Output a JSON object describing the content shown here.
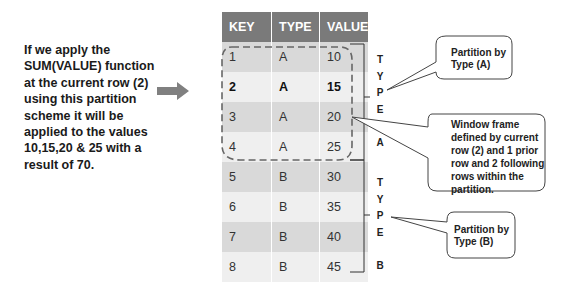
{
  "explanation": {
    "lines": [
      "If we apply the",
      "SUM(VALUE) function",
      "at the current row (2)",
      "using this partition",
      "scheme it will be",
      "applied to the values",
      "10,15,20 & 25 with a",
      "result of 70."
    ]
  },
  "arrow_icon": "right-arrow",
  "table": {
    "headers": [
      "KEY",
      "TYPE",
      "VALUE"
    ],
    "rows": [
      {
        "key": "1",
        "type": "A",
        "value": "10"
      },
      {
        "key": "2",
        "type": "A",
        "value": "15"
      },
      {
        "key": "3",
        "type": "A",
        "value": "20"
      },
      {
        "key": "4",
        "type": "A",
        "value": "25"
      },
      {
        "key": "5",
        "type": "B",
        "value": "30"
      },
      {
        "key": "6",
        "type": "B",
        "value": "35"
      },
      {
        "key": "7",
        "type": "B",
        "value": "40"
      },
      {
        "key": "8",
        "type": "B",
        "value": "45"
      }
    ],
    "current_row_key": "2",
    "header_color": "#7a7a7a"
  },
  "partitions": {
    "a": {
      "letters": [
        "T",
        "Y",
        "P",
        "E",
        "",
        "A"
      ]
    },
    "b": {
      "letters": [
        "T",
        "Y",
        "P",
        "E",
        "",
        "B"
      ]
    }
  },
  "callouts": {
    "partition_a": [
      "Partition by",
      "Type (A)"
    ],
    "window_frame": [
      "Window frame",
      "defined by current",
      "row (2) and 1 prior",
      "row and 2 following",
      "rows within the",
      "partition."
    ],
    "partition_b": [
      "Partition by",
      "Type (B)"
    ]
  }
}
